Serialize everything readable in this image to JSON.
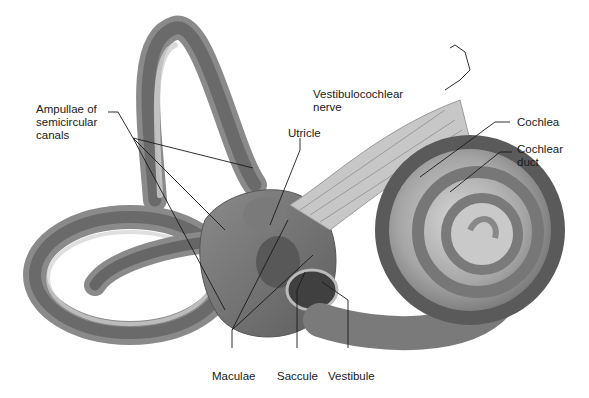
{
  "figure": {
    "colors": {
      "background": "#ffffff",
      "tissue_dark": "#6e6e6e",
      "tissue_mid": "#9a9a9a",
      "tissue_light": "#c9c9c9",
      "leader_line": "#1a1a1a"
    },
    "labels": {
      "ampullae": "Ampullae of\nsemicircular\ncanals",
      "utricle": "Utricle",
      "vestibulocochlear": "Vestibulocochlear\nnerve",
      "cochlea": "Cochlea",
      "cochlear_duct": "Cochlear\nduct",
      "maculae": "Maculae",
      "saccule": "Saccule",
      "vestibule": "Vestibule"
    }
  }
}
